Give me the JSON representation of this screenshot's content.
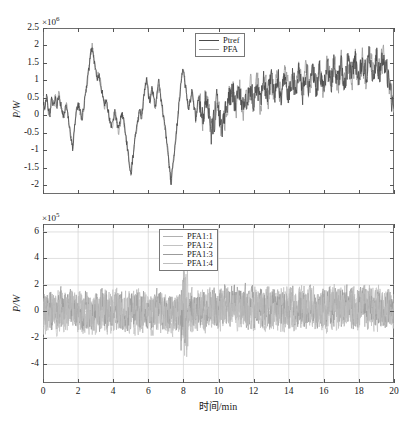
{
  "figure": {
    "width": 406,
    "height": 423,
    "background": "#ffffff",
    "line_color_dark": "#4a4a4a",
    "line_color_light": "#b9b9b9",
    "axis_color": "#6e6e6e",
    "grid_color": "#d2d2d2"
  },
  "xaxis": {
    "label": "时间/min",
    "ticks": [
      0,
      2,
      4,
      6,
      8,
      10,
      12,
      14,
      16,
      18,
      20
    ],
    "tick_labels": [
      "0",
      "2",
      "4",
      "6",
      "8",
      "10",
      "12",
      "14",
      "16",
      "18",
      "20"
    ],
    "min": 0,
    "max": 20
  },
  "top": {
    "ylabel": "P/W",
    "exponent_prefix": "×10",
    "exponent": "6",
    "ymin": -2.25,
    "ymax": 2.5,
    "ticks": [
      2.5,
      2,
      1.5,
      1,
      0.5,
      0,
      -0.5,
      -1,
      -1.5,
      -2
    ],
    "tick_labels": [
      "2.5",
      "2",
      "1.5",
      "1",
      "0.5",
      "0",
      "-0.5",
      "-1",
      "-1.5",
      "-2"
    ],
    "legend": [
      {
        "label": "Ptref",
        "color": "#4a4a4a"
      },
      {
        "label": "PFA",
        "color": "#9a9a9a"
      }
    ]
  },
  "bottom": {
    "ylabel": "P/W",
    "exponent_prefix": "×10",
    "exponent": "5",
    "ymin": -5.4,
    "ymax": 6.6,
    "ticks": [
      6,
      4,
      2,
      0,
      -2,
      -4
    ],
    "tick_labels": [
      "6",
      "4",
      "2",
      "0",
      "-2",
      "-4"
    ],
    "legend": [
      {
        "label": "PFA1:1",
        "color": "#b0b0b0"
      },
      {
        "label": "PFA1:2",
        "color": "#c2c2c2"
      },
      {
        "label": "PFA1:3",
        "color": "#9b9b9b"
      },
      {
        "label": "PFA1:4",
        "color": "#bdbdbd"
      }
    ]
  },
  "chart_data": {
    "type": "line",
    "title": "",
    "xlabel": "时间/min",
    "subplots": [
      {
        "name": "top",
        "ylabel": "P/W",
        "y_exponent": 1000000,
        "ylim": [
          -2.25,
          2.5
        ],
        "xlim": [
          0,
          20
        ],
        "grid": false,
        "legend_position": "top-right",
        "series": [
          {
            "name": "Ptref",
            "color": "#4a4a4a",
            "comment": "reference power, dense noisy trace; large low-frequency swings before t=8, higher-frequency oscillation after t=9",
            "x": [
              0,
              0.1,
              0.2,
              0.3,
              0.4,
              0.5,
              0.6,
              0.7,
              0.8,
              0.9,
              1,
              1.1,
              1.2,
              1.3,
              1.4,
              1.5,
              1.6,
              1.7,
              1.8,
              1.9,
              2,
              2.1,
              2.2,
              2.3,
              2.4,
              2.5,
              2.6,
              2.7,
              2.8,
              2.9,
              3,
              3.1,
              3.2,
              3.3,
              3.4,
              3.5,
              3.6,
              3.7,
              3.8,
              3.9,
              4,
              4.1,
              4.2,
              4.3,
              4.4,
              4.5,
              4.6,
              4.7,
              4.8,
              4.9,
              5,
              5.1,
              5.2,
              5.3,
              5.4,
              5.5,
              5.6,
              5.7,
              5.8,
              5.9,
              6,
              6.1,
              6.2,
              6.3,
              6.4,
              6.5,
              6.6,
              6.7,
              6.8,
              6.9,
              7,
              7.1,
              7.2,
              7.3,
              7.4,
              7.5,
              7.6,
              7.7,
              7.8,
              7.9,
              8,
              8.1,
              8.2,
              8.3,
              8.4,
              8.5,
              8.6,
              8.7,
              8.8,
              8.9,
              9,
              9.1,
              9.2,
              9.3,
              9.4,
              9.5,
              9.6,
              9.7,
              9.8,
              9.9,
              10,
              10.1,
              10.2,
              10.3,
              10.4,
              10.5,
              10.6,
              10.7,
              10.8,
              10.9,
              11,
              11.1,
              11.2,
              11.3,
              11.4,
              11.5,
              11.6,
              11.7,
              11.8,
              11.9,
              12,
              12.1,
              12.2,
              12.3,
              12.4,
              12.5,
              12.6,
              12.7,
              12.8,
              12.9,
              13,
              13.1,
              13.2,
              13.3,
              13.4,
              13.5,
              13.6,
              13.7,
              13.8,
              13.9,
              14,
              14.1,
              14.2,
              14.3,
              14.4,
              14.5,
              14.6,
              14.7,
              14.8,
              14.9,
              15,
              15.1,
              15.2,
              15.3,
              15.4,
              15.5,
              15.6,
              15.7,
              15.8,
              15.9,
              16,
              16.1,
              16.2,
              16.3,
              16.4,
              16.5,
              16.6,
              16.7,
              16.8,
              16.9,
              17,
              17.1,
              17.2,
              17.3,
              17.4,
              17.5,
              17.6,
              17.7,
              17.8,
              17.9,
              18,
              18.1,
              18.2,
              18.3,
              18.4,
              18.5,
              18.6,
              18.7,
              18.8,
              18.9,
              19,
              19.1,
              19.2,
              19.3,
              19.4,
              19.5,
              19.6,
              19.7,
              19.8,
              19.9,
              20
            ],
            "y": [
              0.45,
              0.2,
              0.6,
              0.15,
              0.05,
              0.45,
              0.3,
              0.55,
              0.2,
              0.6,
              0.35,
              0.15,
              -0.05,
              0.4,
              0.05,
              -0.3,
              -0.6,
              -0.95,
              -0.35,
              0.1,
              0.35,
              0.15,
              -0.15,
              0.15,
              0.5,
              0.85,
              1.25,
              1.7,
              2.0,
              1.65,
              1.25,
              1.05,
              1.2,
              0.9,
              0.55,
              0.3,
              0.45,
              0.15,
              -0.1,
              -0.35,
              -0.15,
              0.1,
              -0.2,
              -0.45,
              -0.2,
              0.05,
              -0.15,
              -0.5,
              -0.9,
              -1.35,
              -1.7,
              -1.3,
              -0.85,
              -0.5,
              -0.15,
              0.15,
              -0.1,
              0.35,
              0.7,
              1.05,
              0.6,
              0.35,
              0.75,
              0.55,
              0.25,
              0.6,
              0.95,
              0.55,
              0.2,
              -0.15,
              -0.55,
              -1.0,
              -1.5,
              -1.95,
              -1.45,
              -0.95,
              -0.5,
              0.05,
              0.6,
              1.1,
              1.3,
              0.9,
              0.5,
              0.2,
              0.45,
              0.7,
              0.3,
              -0.1,
              0.25,
              0.6,
              0.2,
              -0.2,
              0.15,
              0.5,
              0.15,
              -0.25,
              -0.6,
              -0.3,
              0.0,
              0.35,
              0.05,
              -0.3,
              -0.6,
              -0.3,
              0.05,
              0.4,
              0.75,
              0.45,
              0.8,
              0.5,
              0.2,
              0.55,
              0.85,
              0.55,
              0.25,
              0.6,
              0.3,
              0.65,
              0.95,
              0.65,
              0.35,
              0.7,
              1.0,
              0.7,
              0.4,
              0.75,
              1.05,
              0.75,
              0.45,
              0.8,
              1.1,
              0.8,
              0.5,
              0.85,
              1.15,
              0.85,
              0.55,
              0.9,
              1.2,
              0.9,
              0.6,
              0.95,
              1.25,
              0.95,
              0.65,
              1.0,
              1.3,
              1.0,
              0.7,
              1.05,
              1.35,
              1.05,
              0.75,
              1.1,
              1.4,
              1.1,
              0.8,
              1.15,
              1.45,
              1.15,
              0.85,
              1.2,
              1.5,
              1.2,
              0.9,
              1.25,
              1.55,
              1.25,
              0.95,
              1.3,
              1.6,
              1.3,
              1.0,
              1.35,
              1.65,
              1.35,
              1.05,
              1.4,
              1.7,
              1.4,
              1.1,
              1.45,
              1.75,
              1.45,
              1.15,
              1.5,
              1.8,
              1.5,
              1.2,
              1.55,
              1.85,
              1.55,
              1.25,
              1.6,
              1.9,
              1.6,
              1.3,
              1.0,
              0.7,
              0.4,
              0.1
            ]
          },
          {
            "name": "PFA",
            "color": "#9a9a9a",
            "comment": "actual aggregated power, closely tracks Ptref"
          }
        ]
      },
      {
        "name": "bottom",
        "ylabel": "P/W",
        "y_exponent": 100000,
        "ylim": [
          -5.4,
          6.6
        ],
        "xlim": [
          0,
          20
        ],
        "grid": true,
        "legend_position": "top-center",
        "series": [
          {
            "name": "PFA1:1",
            "color": "#b0b0b0",
            "comment": "individual unit power, light gray noisy trace, ±4e5 envelope, dense burst near t=8"
          },
          {
            "name": "PFA1:2",
            "color": "#c2c2c2",
            "comment": "individual unit power, overlapping trace"
          },
          {
            "name": "PFA1:3",
            "color": "#9b9b9b",
            "comment": "individual unit power, overlapping trace"
          },
          {
            "name": "PFA1:4",
            "color": "#bdbdbd",
            "comment": "individual unit power, overlapping trace"
          }
        ]
      }
    ]
  }
}
